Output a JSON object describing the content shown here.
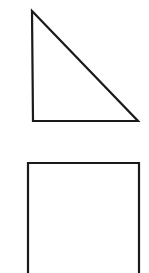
{
  "canvas": {
    "width": 149,
    "height": 273,
    "background": "#ffffff"
  },
  "stroke": {
    "color": "#1a1a1a",
    "width": 2.2
  },
  "shapes": [
    {
      "type": "right-triangle",
      "points": [
        [
          32,
          11
        ],
        [
          33,
          121
        ],
        [
          138,
          121
        ]
      ]
    },
    {
      "type": "square",
      "points": [
        [
          28,
          163
        ],
        [
          139,
          163
        ],
        [
          139,
          274
        ],
        [
          28,
          274
        ]
      ]
    }
  ]
}
